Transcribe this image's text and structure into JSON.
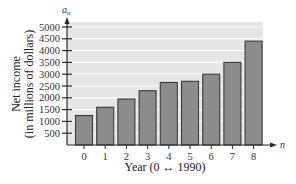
{
  "chart_data": {
    "type": "bar",
    "title": "",
    "xlabel": "Year (0 ↔ 1990)",
    "ylabel_line1": "Net income",
    "ylabel_line2": "(in millions of dollars)",
    "ylabel": "Net income (in millions of dollars)",
    "x_axis_variable": "n",
    "y_axis_variable": "a",
    "y_axis_variable_subscript": "n",
    "categories": [
      "0",
      "1",
      "2",
      "3",
      "4",
      "5",
      "6",
      "7",
      "8"
    ],
    "values": [
      1250,
      1600,
      1950,
      2300,
      2650,
      2700,
      3000,
      3500,
      4400
    ],
    "ylim": [
      0,
      5000
    ],
    "yticks": [
      500,
      1000,
      1500,
      2000,
      2500,
      3000,
      3500,
      4000,
      4500,
      5000
    ],
    "grid": true,
    "legend": null
  },
  "colors": {
    "plot_background": "#e6e6e6",
    "gridline": "#fafafa",
    "bar_fill": "#8c8c8c",
    "bar_stroke": "#3a3a3a",
    "axis": "#2a2a2a"
  }
}
